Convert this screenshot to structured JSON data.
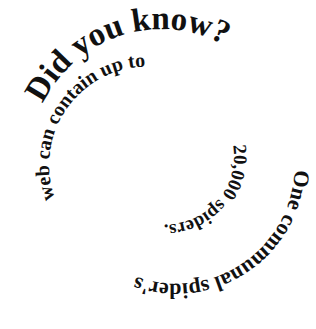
{
  "graphic": {
    "title_segment": "Did you know?",
    "fact_segments": [
      "One communal spider's",
      "web can contain up to",
      "20,000 spiders."
    ],
    "full_text": "Did you know? One communal spider's web can contain up to 20,000 spiders.",
    "text_color": "#111111",
    "background_color": "#ffffff"
  }
}
